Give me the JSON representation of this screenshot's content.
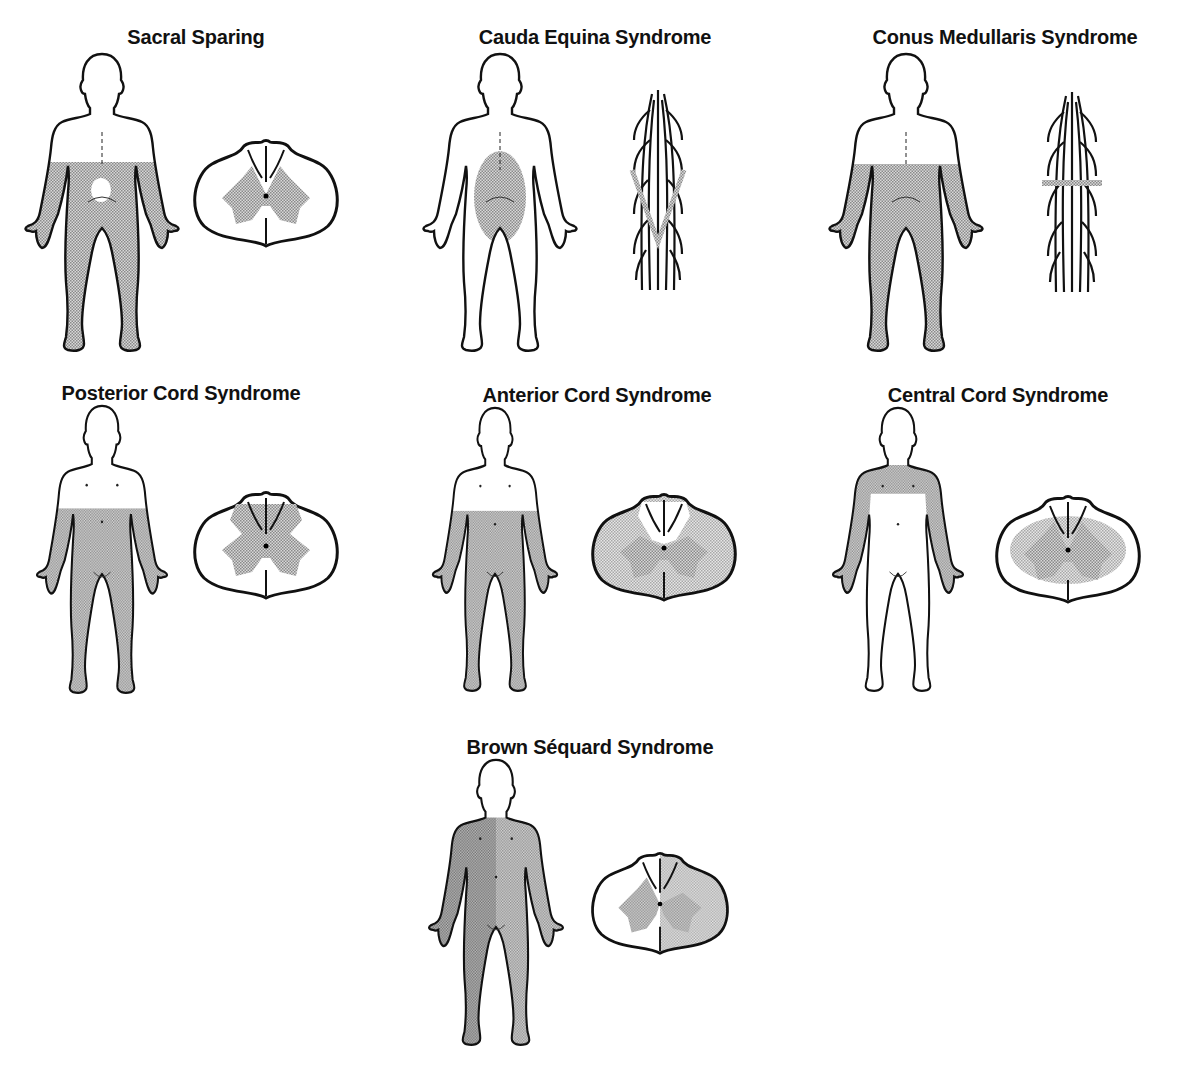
{
  "figure": {
    "colors": {
      "outline": "#111111",
      "stipple": "#9a9a9a",
      "stipple_dark": "#7d7d7d",
      "background": "#ffffff"
    },
    "panels": [
      {
        "id": "sacral-sparing",
        "title": "Sacral Sparing",
        "body_view": "posterior",
        "inset": "cord-cross-section",
        "shaded_region": "lower body below waist, sparing perianal area",
        "cord_shading": "gray matter and lateral tracts; posterior columns spared"
      },
      {
        "id": "cauda-equina",
        "title": "Cauda Equina Syndrome",
        "body_view": "posterior",
        "inset": "nerve-roots",
        "shaded_region": "buttocks / saddle area",
        "cord_shading": "lower nerve roots (V-shaped lesion)"
      },
      {
        "id": "conus-medullaris",
        "title": "Conus Medullaris Syndrome",
        "body_view": "posterior",
        "inset": "nerve-roots",
        "shaded_region": "lower body below waist",
        "cord_shading": "horizontal band across conus"
      },
      {
        "id": "posterior-cord",
        "title": "Posterior Cord Syndrome",
        "body_view": "anterior",
        "inset": "cord-cross-section",
        "shaded_region": "below umbilicus",
        "cord_shading": "posterior columns and gray matter"
      },
      {
        "id": "anterior-cord",
        "title": "Anterior Cord Syndrome",
        "body_view": "anterior",
        "inset": "cord-cross-section",
        "shaded_region": "below umbilicus",
        "cord_shading": "anterior two-thirds; posterior columns spared"
      },
      {
        "id": "central-cord",
        "title": "Central Cord Syndrome",
        "body_view": "anterior",
        "inset": "cord-cross-section",
        "shaded_region": "upper limbs and shoulders",
        "cord_shading": "central gray matter and surrounding tracts"
      },
      {
        "id": "brown-sequard",
        "title": "Brown Séquard Syndrome",
        "body_view": "anterior",
        "inset": "cord-cross-section",
        "shaded_region": "whole body, darker on one side",
        "cord_shading": "hemisection of cord"
      }
    ]
  }
}
